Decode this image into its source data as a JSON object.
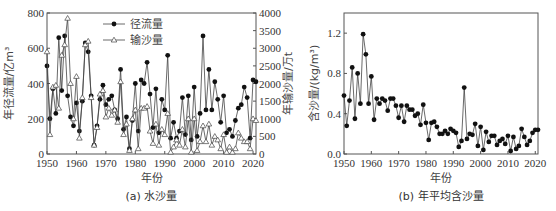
{
  "chart_data": [
    {
      "type": "line",
      "panel": "a",
      "caption": "(a) 水沙量",
      "xlabel": "年份",
      "ylabel": "年径流量/亿m³",
      "y2label": "年输沙量/万t",
      "xlim": [
        1950,
        2021
      ],
      "ylim": [
        0,
        800
      ],
      "y2lim": [
        0,
        4000
      ],
      "xticks": [
        1950,
        1960,
        1970,
        1980,
        1990,
        2000,
        2010,
        2020
      ],
      "yticks": [
        0,
        200,
        400,
        600,
        800
      ],
      "y2ticks": [
        0,
        500,
        1000,
        1500,
        2000,
        2500,
        3000,
        3500,
        4000
      ],
      "legend": [
        "径流量",
        "输沙量"
      ],
      "legend_position": "upper center",
      "grid": false,
      "x": [
        1950,
        1951,
        1952,
        1953,
        1954,
        1955,
        1956,
        1957,
        1958,
        1959,
        1960,
        1961,
        1962,
        1963,
        1964,
        1965,
        1966,
        1967,
        1968,
        1969,
        1970,
        1971,
        1972,
        1973,
        1974,
        1975,
        1976,
        1977,
        1978,
        1979,
        1980,
        1981,
        1982,
        1983,
        1984,
        1985,
        1986,
        1987,
        1988,
        1989,
        1990,
        1991,
        1992,
        1993,
        1994,
        1995,
        1996,
        1997,
        1998,
        1999,
        2000,
        2001,
        2002,
        2003,
        2004,
        2005,
        2006,
        2007,
        2008,
        2009,
        2010,
        2011,
        2012,
        2013,
        2014,
        2015,
        2016,
        2017,
        2018,
        2019,
        2020,
        2021
      ],
      "series": [
        {
          "name": "径流量",
          "axis": "left",
          "marker": "filled-circle",
          "values": [
            500,
            200,
            370,
            230,
            660,
            360,
            670,
            330,
            210,
            160,
            290,
            130,
            300,
            630,
            580,
            330,
            50,
            160,
            310,
            390,
            280,
            310,
            330,
            250,
            200,
            480,
            140,
            210,
            30,
            190,
            400,
            130,
            420,
            400,
            520,
            340,
            150,
            370,
            120,
            310,
            250,
            560,
            90,
            180,
            90,
            130,
            320,
            110,
            330,
            80,
            380,
            100,
            230,
            670,
            250,
            480,
            250,
            410,
            310,
            180,
            330,
            120,
            140,
            100,
            190,
            260,
            280,
            380,
            320,
            90,
            420,
            410
          ]
        },
        {
          "name": "输沙量",
          "axis": "right",
          "marker": "open-triangle",
          "values": [
            2900,
            550,
            1900,
            1950,
            1300,
            2800,
            3100,
            3850,
            2000,
            1000,
            2200,
            450,
            1600,
            3100,
            3200,
            1600,
            250,
            750,
            1700,
            1800,
            1050,
            1300,
            1100,
            1250,
            900,
            2050,
            550,
            850,
            100,
            1000,
            1250,
            150,
            1300,
            1300,
            1350,
            650,
            300,
            850,
            250,
            700,
            550,
            1150,
            50,
            200,
            400,
            250,
            700,
            200,
            1000,
            50,
            1000,
            100,
            350,
            800,
            350,
            850,
            250,
            500,
            400,
            150,
            550,
            50,
            200,
            50,
            150,
            600,
            450,
            350,
            350,
            150,
            1000,
            950
          ]
        }
      ]
    },
    {
      "type": "line",
      "panel": "b",
      "caption": "(b) 年平均含沙量",
      "xlabel": "年份",
      "ylabel": "含沙量/(kg/m³)",
      "xlim": [
        1950,
        2021
      ],
      "ylim": [
        0.0,
        1.4
      ],
      "xticks": [
        1950,
        1960,
        1970,
        1980,
        1990,
        2000,
        2010,
        2020
      ],
      "yticks": [
        "0.0",
        "0.4",
        "0.8",
        "1.2"
      ],
      "grid": false,
      "x": [
        1950,
        1951,
        1952,
        1953,
        1954,
        1955,
        1956,
        1957,
        1958,
        1959,
        1960,
        1961,
        1962,
        1963,
        1964,
        1965,
        1966,
        1967,
        1968,
        1969,
        1970,
        1971,
        1972,
        1973,
        1974,
        1975,
        1976,
        1977,
        1978,
        1979,
        1980,
        1981,
        1982,
        1983,
        1984,
        1985,
        1986,
        1987,
        1988,
        1989,
        1990,
        1991,
        1992,
        1993,
        1994,
        1995,
        1996,
        1997,
        1998,
        1999,
        2000,
        2001,
        2002,
        2003,
        2004,
        2005,
        2006,
        2007,
        2008,
        2009,
        2010,
        2011,
        2012,
        2013,
        2014,
        2015,
        2016,
        2017,
        2018,
        2019,
        2020,
        2021
      ],
      "series": [
        {
          "name": "含沙量",
          "marker": "filled-circle",
          "values": [
            0.58,
            0.28,
            0.53,
            0.86,
            0.35,
            0.8,
            0.5,
            1.19,
            0.99,
            0.5,
            0.77,
            0.34,
            0.55,
            0.5,
            0.55,
            0.53,
            0.43,
            0.55,
            0.55,
            0.48,
            0.36,
            0.48,
            0.32,
            0.48,
            0.44,
            0.44,
            0.38,
            0.4,
            0.29,
            0.49,
            0.31,
            0.14,
            0.31,
            0.32,
            0.27,
            0.2,
            0.2,
            0.23,
            0.2,
            0.25,
            0.23,
            0.21,
            0.07,
            0.13,
            0.66,
            0.15,
            0.2,
            0.19,
            0.3,
            0.08,
            0.27,
            0.04,
            0.22,
            0.12,
            0.18,
            0.18,
            0.09,
            0.13,
            0.15,
            0.1,
            0.18,
            0.03,
            0.17,
            0.05,
            0.08,
            0.25,
            0.17,
            0.09,
            0.13,
            0.21,
            0.24,
            0.24
          ]
        }
      ]
    }
  ]
}
